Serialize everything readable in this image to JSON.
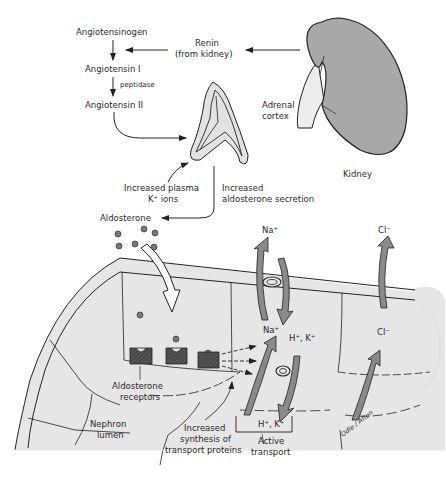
{
  "pathway": {
    "angiotensinogen": "Angiotensinogen",
    "angiotensin_i": "Angiotensin I",
    "peptidase": "peptidase",
    "angiotensin_ii": "Angiotensin II",
    "renin_line1": "Renin",
    "renin_line2": "(from kidney)"
  },
  "organs": {
    "kidney": "Kidney",
    "adrenal_line1": "Adrenal",
    "adrenal_line2": "cortex"
  },
  "stimuli": {
    "plasma_line1": "Increased plasma",
    "plasma_line2": "K⁺ ions",
    "secretion_line1": "Increased",
    "secretion_line2": "aldosterone secretion",
    "aldosterone": "Aldosterone"
  },
  "ions": {
    "na_top": "Na⁺",
    "cl_top": "Cl⁻",
    "na_mid": "Na⁺",
    "hk_mid": "H⁺, K⁺",
    "cl_mid": "Cl⁻",
    "hk_bottom": "H⁺, K⁺"
  },
  "cell_labels": {
    "receptors_line1": "Aldosterone",
    "receptors_line2": "receptors",
    "lumen_line1": "Nephron",
    "lumen_line2": "lumen",
    "synthesis_line1": "Increased",
    "synthesis_line2": "synthesis of",
    "synthesis_line3": "transport proteins",
    "active_line1": "Active",
    "active_line2": "transport"
  },
  "signature": "Odle / Afton",
  "colors": {
    "cell_fill": "#e6e6e6",
    "kidney_fill": "#a8a8a8",
    "arrow_fill": "#8a8a8a",
    "line": "#222222"
  }
}
